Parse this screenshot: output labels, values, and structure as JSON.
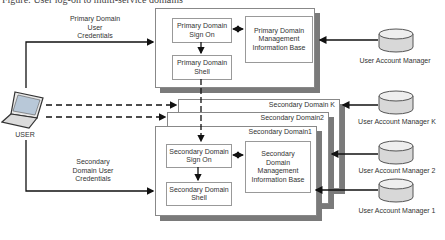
{
  "caption": "Figure: User log-on to multi-service domains",
  "user": {
    "label": "USER"
  },
  "primary": {
    "credentials_label": [
      "Primary Domain",
      "User",
      "Credentials"
    ],
    "sign_on": "Primary Domain Sign On",
    "shell": "Primary Domain Shell",
    "mib": "Primary Domain Management Information Base",
    "account_manager": "User Account Manager"
  },
  "secondary": {
    "credentials_label": [
      "Secondary",
      "Domain User",
      "Credentials"
    ],
    "domains": [
      {
        "title": "Secondary Domain K"
      },
      {
        "title": "Secondary Domain2"
      },
      {
        "title": "Secondary Domain1"
      }
    ],
    "sign_on": "Secondary Domain Sign On",
    "shell": "Secondary Domain Shell",
    "mib": "Secondary Domain Management Information Base",
    "account_managers": [
      {
        "label": "User Account Manager K"
      },
      {
        "label": "User Account Manager 2"
      },
      {
        "label": "User Account Manager 1"
      }
    ]
  },
  "colors": {
    "line": "#111111",
    "box_border": "#888888",
    "shadow": "#7a7a7a",
    "cylinder": "#d8d8d8"
  }
}
